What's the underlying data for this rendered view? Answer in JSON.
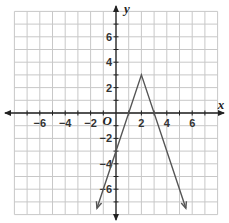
{
  "chart_data": {
    "type": "line",
    "title": "",
    "xlabel": "x",
    "ylabel": "y",
    "origin_label": "O",
    "xlim": [
      -8,
      8
    ],
    "ylim": [
      -8,
      8
    ],
    "grid": true,
    "x_ticks": [
      -6,
      -4,
      -2,
      2,
      4,
      6
    ],
    "y_ticks": [
      6,
      4,
      2,
      -2,
      -4,
      -6
    ],
    "x_tick_labels": [
      "−6",
      "−4",
      "−2",
      "2",
      "4",
      "6"
    ],
    "y_tick_labels": [
      "6",
      "4",
      "2",
      "−2",
      "−4",
      "−6"
    ],
    "series": [
      {
        "name": "y = -3|x - 2| + 3",
        "x": [
          -1.5,
          2,
          5.5
        ],
        "y": [
          -7.5,
          3,
          -7.5
        ],
        "color": "#555555",
        "arrows_at_ends": true
      }
    ],
    "key_points": {
      "vertex": [
        2,
        3
      ],
      "x_intercepts": [
        1,
        3
      ],
      "y_intercept": -3
    }
  },
  "colors": {
    "grid": "#c8c8c8",
    "axis": "#222222",
    "line": "#555555"
  }
}
